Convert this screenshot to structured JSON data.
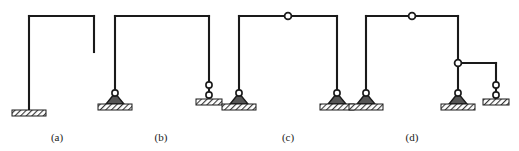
{
  "figure": {
    "type": "engineering-diagram",
    "background_color": "#ffffff",
    "line_color": "#1a1a1a",
    "hatch_color": "#3a3a3a",
    "width": 519,
    "height": 151
  },
  "captions": [
    {
      "id": "a",
      "label": "(a)",
      "x": 57,
      "y": 131
    },
    {
      "id": "b",
      "label": "(b)",
      "x": 161,
      "y": 131
    },
    {
      "id": "c",
      "label": "(c)",
      "x": 288,
      "y": 131
    },
    {
      "id": "d",
      "label": "(d)",
      "x": 412,
      "y": 131
    }
  ],
  "frames": [
    {
      "id": "a",
      "label": "(a)",
      "description": "Cantilever frame: one fixed support at base of left column, top beam with downward stub at right end",
      "members": [
        {
          "name": "left-column",
          "x1": 29,
          "y1": 16,
          "x2": 29,
          "y2": 110
        },
        {
          "name": "top-beam",
          "x1": 29,
          "y1": 16,
          "x2": 94,
          "y2": 16
        },
        {
          "name": "right-stub",
          "x1": 94,
          "y1": 16,
          "x2": 94,
          "y2": 52
        }
      ],
      "supports": [
        {
          "name": "fixed-support",
          "type": "fixed",
          "x": 29,
          "y": 110
        }
      ],
      "hinges": []
    },
    {
      "id": "b",
      "label": "(b)",
      "description": "Portal frame: pin support at base of left column, link (two-pin) support at base of right column",
      "members": [
        {
          "name": "left-column",
          "x1": 115,
          "y1": 16,
          "x2": 115,
          "y2": 104
        },
        {
          "name": "top-beam",
          "x1": 115,
          "y1": 16,
          "x2": 209,
          "y2": 16
        },
        {
          "name": "right-column",
          "x1": 209,
          "y1": 16,
          "x2": 209,
          "y2": 99
        }
      ],
      "supports": [
        {
          "name": "pin-support",
          "type": "pin",
          "x": 115,
          "y": 104
        },
        {
          "name": "link-support",
          "type": "link",
          "x": 209,
          "y": 99
        }
      ],
      "hinges": []
    },
    {
      "id": "c",
      "label": "(c)",
      "description": "Three-hinged portal frame: pin supports at both column bases plus internal hinge at midspan of top beam",
      "members": [
        {
          "name": "left-column",
          "x1": 239,
          "y1": 16,
          "x2": 239,
          "y2": 104
        },
        {
          "name": "top-beam-left",
          "x1": 239,
          "y1": 16,
          "x2": 288,
          "y2": 16
        },
        {
          "name": "top-beam-right",
          "x1": 288,
          "y1": 16,
          "x2": 337,
          "y2": 16
        },
        {
          "name": "right-column",
          "x1": 337,
          "y1": 16,
          "x2": 337,
          "y2": 104
        }
      ],
      "supports": [
        {
          "name": "pin-support-left",
          "type": "pin",
          "x": 239,
          "y": 104
        },
        {
          "name": "pin-support-right",
          "type": "pin",
          "x": 337,
          "y": 104
        }
      ],
      "hinges": [
        {
          "name": "top-beam-hinge",
          "x": 288,
          "y": 16
        }
      ]
    },
    {
      "id": "d",
      "label": "(d)",
      "description": "Compound frame: pin supports at two column bases, internal hinge at top beam, internal hinge joining a cantilever beam to the middle column, link support under right end of that beam",
      "members": [
        {
          "name": "left-column",
          "x1": 366,
          "y1": 16,
          "x2": 366,
          "y2": 104
        },
        {
          "name": "top-beam-left",
          "x1": 366,
          "y1": 16,
          "x2": 412,
          "y2": 16
        },
        {
          "name": "top-beam-right",
          "x1": 412,
          "y1": 16,
          "x2": 458,
          "y2": 16
        },
        {
          "name": "middle-column",
          "x1": 458,
          "y1": 16,
          "x2": 458,
          "y2": 104
        },
        {
          "name": "side-beam",
          "x1": 458,
          "y1": 63,
          "x2": 496,
          "y2": 63
        },
        {
          "name": "right-column",
          "x1": 496,
          "y1": 63,
          "x2": 496,
          "y2": 99
        }
      ],
      "supports": [
        {
          "name": "pin-support-left",
          "type": "pin",
          "x": 366,
          "y": 104
        },
        {
          "name": "pin-support-middle",
          "type": "pin",
          "x": 458,
          "y": 104
        },
        {
          "name": "link-support-right",
          "type": "link",
          "x": 496,
          "y": 99
        }
      ],
      "hinges": [
        {
          "name": "top-beam-hinge",
          "x": 412,
          "y": 16
        },
        {
          "name": "side-beam-hinge",
          "x": 458,
          "y": 63
        }
      ]
    }
  ]
}
